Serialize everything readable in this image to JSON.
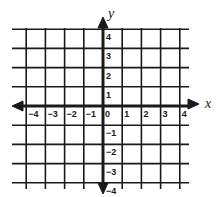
{
  "figure": {
    "type": "coordinate-plane",
    "x_axis": {
      "label": "x",
      "min": -4,
      "max": 4,
      "ticks": [
        -4,
        -3,
        -2,
        -1,
        0,
        1,
        2,
        3,
        4
      ],
      "tick_labels": [
        "−4",
        "−3",
        "−2",
        "−1",
        "0",
        "1",
        "2",
        "3",
        "4"
      ]
    },
    "y_axis": {
      "label": "y",
      "min": -4,
      "max": 4,
      "ticks": [
        4,
        3,
        2,
        1,
        -1,
        -2,
        -3,
        -4
      ],
      "tick_labels": [
        "4",
        "3",
        "2",
        "1",
        "−1",
        "−2",
        "−3",
        "−4"
      ]
    },
    "grid": true,
    "arrows": [
      "left",
      "right",
      "up",
      "down"
    ],
    "colors": {
      "background": "#ffffff",
      "lines": "#1a1a1a"
    }
  }
}
